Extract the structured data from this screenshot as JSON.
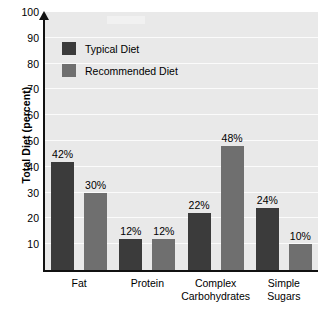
{
  "chart_data": {
    "type": "bar",
    "title": "",
    "subtitle": "",
    "xlabel": "",
    "ylabel": "Total Diet (percent)",
    "categories": [
      "Fat",
      "Protein",
      "Complex\nCarbohydrates",
      "Simple\nSugars"
    ],
    "series": [
      {
        "name": "Typical Diet",
        "color": "#3b3b3b",
        "values": [
          42,
          12,
          22,
          24
        ],
        "labels": [
          "42%",
          "12%",
          "22%",
          "24%"
        ]
      },
      {
        "name": "Recommended Diet",
        "color": "#6f6f6f",
        "values": [
          30,
          12,
          48,
          10
        ],
        "labels": [
          "30%",
          "12%",
          "48%",
          "10%"
        ]
      }
    ],
    "ylim": [
      0,
      100
    ],
    "ytick_labels": [
      "10",
      "20",
      "30",
      "40",
      "50",
      "60",
      "70",
      "80",
      "90",
      "100"
    ],
    "ytick_values": [
      10,
      20,
      30,
      40,
      50,
      60,
      70,
      80,
      90,
      100
    ],
    "grid": true,
    "grid_color": "#fbfbfb",
    "plot_background": "#e9e9e9",
    "axis_color": "#111111",
    "legend_position": "top-left"
  },
  "legend": {
    "entries": [
      {
        "label": "Typical Diet",
        "color": "#3b3b3b"
      },
      {
        "label": "Recommended Diet",
        "color": "#6f6f6f"
      }
    ]
  }
}
